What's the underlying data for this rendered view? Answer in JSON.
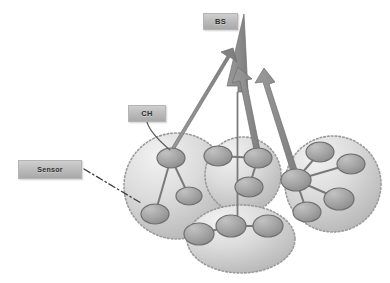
{
  "figure": {
    "background": "#ffffff"
  },
  "labels": {
    "base_station": "BS",
    "cluster_head": "CH",
    "sensor": "Sensor"
  },
  "colors": {
    "node_fill_light": "#b6b6b6",
    "node_fill_dark": "#8e8e8e",
    "node_stroke": "#6f6f6f",
    "cluster_fill_light": "#eeeeee",
    "cluster_fill_dark": "#bcbcbc",
    "cluster_border": "#9a9a9a",
    "link": "#7a7a7a",
    "arrow": "#8a8a8a",
    "arrow_stroke": "#6e6e6e",
    "callout_fill": "#bdbdbd",
    "callout_text": "#2f2f2f",
    "leader": "#5a5a5a"
  },
  "diagram": {
    "type": "network-topology",
    "clusters": [
      {
        "id": "cluster-left",
        "shape": "circle",
        "cx": 177,
        "cy": 186,
        "rx": 53,
        "ry": 53,
        "nodes": [
          {
            "id": "ch-left",
            "role": "cluster-head",
            "cx": 171,
            "cy": 158,
            "rx": 14,
            "ry": 10
          },
          {
            "id": "sensor-left-1",
            "role": "sensor",
            "cx": 189,
            "cy": 196,
            "rx": 13,
            "ry": 9
          },
          {
            "id": "sensor-left-2",
            "role": "sensor",
            "cx": 155,
            "cy": 214,
            "rx": 14,
            "ry": 10
          }
        ],
        "links": [
          {
            "from": "ch-left",
            "to": "sensor-left-1"
          },
          {
            "from": "ch-left",
            "to": "sensor-left-2"
          }
        ]
      },
      {
        "id": "cluster-mid",
        "shape": "circle",
        "cx": 243,
        "cy": 175,
        "rx": 38,
        "ry": 38,
        "nodes": [
          {
            "id": "ch-mid",
            "role": "cluster-head",
            "cx": 258,
            "cy": 158,
            "rx": 14,
            "ry": 10
          },
          {
            "id": "sensor-mid-1",
            "role": "sensor",
            "cx": 218,
            "cy": 156,
            "rx": 14,
            "ry": 10
          },
          {
            "id": "sensor-mid-2",
            "role": "sensor",
            "cx": 249,
            "cy": 187,
            "rx": 14,
            "ry": 10
          }
        ],
        "links": [
          {
            "from": "ch-mid",
            "to": "sensor-mid-1"
          },
          {
            "from": "ch-mid",
            "to": "sensor-mid-2"
          }
        ]
      },
      {
        "id": "cluster-right",
        "shape": "circle",
        "cx": 333,
        "cy": 184,
        "rx": 48,
        "ry": 48,
        "nodes": [
          {
            "id": "ch-right",
            "role": "cluster-head",
            "cx": 296,
            "cy": 180,
            "rx": 15,
            "ry": 11
          },
          {
            "id": "sensor-right-1",
            "role": "sensor",
            "cx": 320,
            "cy": 152,
            "rx": 14,
            "ry": 10
          },
          {
            "id": "sensor-right-2",
            "role": "sensor",
            "cx": 351,
            "cy": 164,
            "rx": 14,
            "ry": 10
          },
          {
            "id": "sensor-right-3",
            "role": "sensor",
            "cx": 339,
            "cy": 199,
            "rx": 15,
            "ry": 11
          },
          {
            "id": "sensor-right-4",
            "role": "sensor",
            "cx": 307,
            "cy": 212,
            "rx": 14,
            "ry": 10
          }
        ],
        "links": [
          {
            "from": "ch-right",
            "to": "sensor-right-1"
          },
          {
            "from": "ch-right",
            "to": "sensor-right-2"
          },
          {
            "from": "ch-right",
            "to": "sensor-right-3"
          },
          {
            "from": "ch-right",
            "to": "sensor-right-4"
          }
        ]
      },
      {
        "id": "cluster-bottom",
        "shape": "ellipse",
        "cx": 241,
        "cy": 239,
        "rx": 54,
        "ry": 34,
        "nodes": [
          {
            "id": "ch-bottom",
            "role": "cluster-head",
            "cx": 231,
            "cy": 226,
            "rx": 15,
            "ry": 11
          },
          {
            "id": "sensor-bottom-1",
            "role": "sensor",
            "cx": 199,
            "cy": 234,
            "rx": 15,
            "ry": 11
          },
          {
            "id": "sensor-bottom-2",
            "role": "sensor",
            "cx": 268,
            "cy": 226,
            "rx": 15,
            "ry": 11
          }
        ],
        "links": [
          {
            "from": "ch-bottom",
            "to": "sensor-bottom-1"
          },
          {
            "from": "ch-bottom",
            "to": "sensor-bottom-2"
          }
        ]
      }
    ],
    "uplinks": [
      {
        "id": "uplink-left",
        "from": "ch-left",
        "to": "base-station",
        "x1": 172,
        "y1": 152,
        "x2": 239,
        "y2": 44,
        "width": 4
      },
      {
        "id": "uplink-mid",
        "from": "ch-mid",
        "to": "base-station",
        "x1": 258,
        "y1": 152,
        "x2": 240,
        "y2": 70,
        "width": 4
      },
      {
        "id": "uplink-right",
        "from": "ch-right",
        "to": "base-station",
        "x1": 296,
        "y1": 174,
        "x2": 263,
        "y2": 70,
        "width": 4
      },
      {
        "id": "uplink-bottom",
        "from": "ch-bottom",
        "to": "base-station",
        "x1": 231,
        "y1": 220,
        "x2": 244,
        "y2": 18,
        "width": 11
      }
    ],
    "leader_lines": [
      {
        "id": "leader-ch",
        "style": "solid",
        "x1": 147,
        "y1": 122,
        "x2": 170,
        "y2": 150
      },
      {
        "id": "leader-sensor",
        "style": "dash-dot",
        "x1": 84,
        "y1": 169,
        "x2": 141,
        "y2": 203
      }
    ],
    "base_station_anchor": {
      "x": 244,
      "y": 16
    }
  }
}
